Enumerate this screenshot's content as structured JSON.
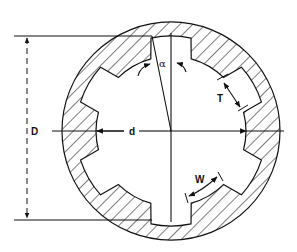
{
  "diagram": {
    "type": "internal-spline-cross-section",
    "labels": {
      "major_diameter": "D",
      "minor_diameter": "d",
      "angle": "α",
      "tooth_thickness": "T",
      "space_width": "W"
    },
    "geometry": {
      "center": [
        171,
        131
      ],
      "outer_radius": 109,
      "major_radius": 95,
      "minor_radius": 75,
      "tooth_count": 6
    },
    "colors": {
      "line": "#111111",
      "background": "#ffffff"
    }
  }
}
